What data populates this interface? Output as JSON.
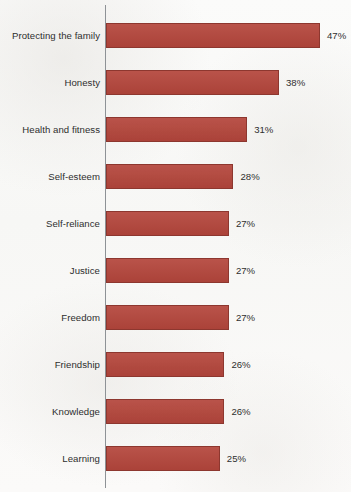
{
  "chart_data": {
    "type": "bar",
    "orientation": "horizontal",
    "title": "",
    "subtitle": "",
    "xlabel": "",
    "ylabel": "",
    "grid": false,
    "legend": null,
    "axis_visible": true,
    "xlim": [
      0,
      47
    ],
    "value_suffix": "%",
    "bar_color": "#b4463c",
    "bar_border_color": "#8d372f",
    "background_color": "#fbfbfa",
    "text_color": "#2e2e2e",
    "axis_color": "#8e9296",
    "categories": [
      "Protecting the family",
      "Honesty",
      "Health and fitness",
      "Self-esteem",
      "Self-reliance",
      "Justice",
      "Freedom",
      "Friendship",
      "Knowledge",
      "Learning"
    ],
    "values": [
      47,
      38,
      31,
      28,
      27,
      27,
      27,
      26,
      26,
      25
    ],
    "value_labels": [
      "47%",
      "38%",
      "31%",
      "28%",
      "27%",
      "27%",
      "27%",
      "26%",
      "26%",
      "25%"
    ],
    "bars": [
      {
        "label": "Protecting the family",
        "value": 47,
        "value_label": "47%"
      },
      {
        "label": "Honesty",
        "value": 38,
        "value_label": "38%"
      },
      {
        "label": "Health and fitness",
        "value": 31,
        "value_label": "31%"
      },
      {
        "label": "Self-esteem",
        "value": 28,
        "value_label": "28%"
      },
      {
        "label": "Self-reliance",
        "value": 27,
        "value_label": "27%"
      },
      {
        "label": "Justice",
        "value": 27,
        "value_label": "27%"
      },
      {
        "label": "Freedom",
        "value": 27,
        "value_label": "27%"
      },
      {
        "label": "Friendship",
        "value": 26,
        "value_label": "26%"
      },
      {
        "label": "Knowledge",
        "value": 26,
        "value_label": "26%"
      },
      {
        "label": "Learning",
        "value": 25,
        "value_label": "25%"
      }
    ]
  },
  "layout": {
    "axis_x": 105,
    "bar_start_x": 106,
    "first_bar_top": 23,
    "row_pitch": 47,
    "bar_height": 25,
    "px_per_unit": 4.553,
    "value_gap": 7
  }
}
